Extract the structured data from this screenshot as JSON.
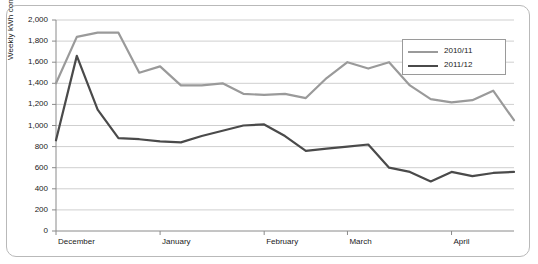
{
  "chart_data": {
    "type": "line",
    "title": "",
    "xlabel": "",
    "ylabel": "Weekly kWh consumption",
    "ylim": [
      0,
      2000
    ],
    "ytick_labels": [
      "0",
      "200",
      "400",
      "600",
      "800",
      "1,000",
      "1,200",
      "1,400",
      "1,600",
      "1,800",
      "2,000"
    ],
    "ytick_values": [
      0,
      200,
      400,
      600,
      800,
      1000,
      1200,
      1400,
      1600,
      1800,
      2000
    ],
    "xtick_labels": [
      "December",
      "January",
      "February",
      "March",
      "April"
    ],
    "xtick_values": [
      0,
      5,
      10,
      14,
      19
    ],
    "grid": true,
    "legend_position": "top-right",
    "colors": {
      "series1": "#9a9a9a",
      "series2": "#4a4a4a",
      "grid": "#cfcfcf",
      "axis": "#8a8a8a"
    },
    "x": [
      0,
      1,
      2,
      3,
      4,
      5,
      6,
      7,
      8,
      9,
      10,
      11,
      12,
      13,
      14,
      15,
      16,
      17,
      18,
      19,
      20,
      21,
      22
    ],
    "series": [
      {
        "name": "2010/11",
        "color": "#9a9a9a",
        "values": [
          1400,
          1840,
          1880,
          1880,
          1500,
          1560,
          1380,
          1380,
          1400,
          1300,
          1290,
          1300,
          1260,
          1450,
          1600,
          1540,
          1600,
          1380,
          1250,
          1220,
          1240,
          1330,
          1050
        ]
      },
      {
        "name": "2011/12",
        "color": "#4a4a4a",
        "values": [
          860,
          1660,
          1150,
          880,
          870,
          850,
          840,
          900,
          950,
          1000,
          1010,
          900,
          760,
          780,
          800,
          820,
          600,
          560,
          470,
          560,
          520,
          550,
          560
        ]
      }
    ]
  },
  "legend": {
    "items": [
      {
        "label": "2010/11",
        "color": "#9a9a9a"
      },
      {
        "label": "2011/12",
        "color": "#4a4a4a"
      }
    ]
  }
}
